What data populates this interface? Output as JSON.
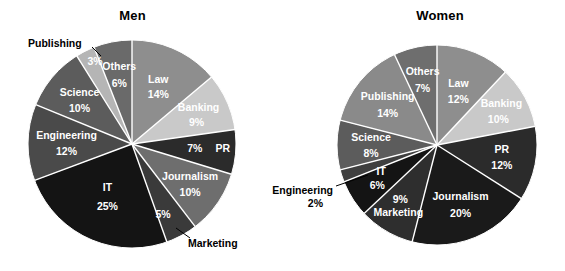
{
  "figure": {
    "background": "#ffffff",
    "label_color_inside": "#ffffff",
    "label_color_outside": "#000000",
    "separator_color": "#ffffff"
  },
  "chart_data": [
    {
      "type": "pie",
      "title": "Men",
      "unit": "%",
      "start_angle_deg": 0,
      "direction": "clockwise",
      "legend": "none",
      "categories": [
        "Law",
        "Banking",
        "PR",
        "Journalism",
        "Marketing",
        "IT",
        "Engineering",
        "Science",
        "Publishing",
        "Others"
      ],
      "values": [
        14,
        9,
        7,
        10,
        5,
        25,
        12,
        10,
        3,
        6
      ],
      "labels": [
        {
          "name": "Law",
          "value": "14%",
          "placement": "inside"
        },
        {
          "name": "Banking",
          "value": "9%",
          "placement": "inside"
        },
        {
          "name": "PR",
          "value": "7%",
          "placement": "inside"
        },
        {
          "name": "Journalism",
          "value": "10%",
          "placement": "inside"
        },
        {
          "name": "Marketing",
          "value": "5%",
          "placement": "outside-leader"
        },
        {
          "name": "IT",
          "value": "25%",
          "placement": "inside"
        },
        {
          "name": "Engineering",
          "value": "12%",
          "placement": "inside"
        },
        {
          "name": "Science",
          "value": "10%",
          "placement": "inside"
        },
        {
          "name": "Publishing",
          "value": "3%",
          "placement": "outside-leader"
        },
        {
          "name": "Others",
          "value": "6%",
          "placement": "inside"
        }
      ],
      "colors": [
        "#8e8e8e",
        "#c9c9c9",
        "#2b2b2b",
        "#6e6e6e",
        "#3a3a3a",
        "#141414",
        "#4a4a4a",
        "#5c5c5c",
        "#b5b5b5",
        "#6a6a6a"
      ]
    },
    {
      "type": "pie",
      "title": "Women",
      "unit": "%",
      "start_angle_deg": 0,
      "direction": "clockwise",
      "legend": "none",
      "categories": [
        "Law",
        "Banking",
        "PR",
        "Journalism",
        "Marketing",
        "IT",
        "Engineering",
        "Science",
        "Publishing",
        "Others"
      ],
      "values": [
        12,
        10,
        12,
        20,
        9,
        6,
        2,
        8,
        14,
        7
      ],
      "labels": [
        {
          "name": "Law",
          "value": "12%",
          "placement": "inside"
        },
        {
          "name": "Banking",
          "value": "10%",
          "placement": "inside"
        },
        {
          "name": "PR",
          "value": "12%",
          "placement": "inside"
        },
        {
          "name": "Journalism",
          "value": "20%",
          "placement": "inside"
        },
        {
          "name": "Marketing",
          "value": "9%",
          "placement": "inside"
        },
        {
          "name": "IT",
          "value": "6%",
          "placement": "inside"
        },
        {
          "name": "Engineering",
          "value": "2%",
          "placement": "outside-leader"
        },
        {
          "name": "Science",
          "value": "8%",
          "placement": "inside"
        },
        {
          "name": "Publishing",
          "value": "14%",
          "placement": "inside"
        },
        {
          "name": "Others",
          "value": "7%",
          "placement": "inside"
        }
      ],
      "colors": [
        "#8e8e8e",
        "#c9c9c9",
        "#2b2b2b",
        "#1a1a1a",
        "#2e2e2e",
        "#141414",
        "#3f3f3f",
        "#5c5c5c",
        "#8a8a8a",
        "#6e6e6e"
      ]
    }
  ],
  "men": {
    "title": "Men",
    "slices": {
      "law": {
        "name": "Law",
        "pct": "14%"
      },
      "banking": {
        "name": "Banking",
        "pct": "9%"
      },
      "pr": {
        "name": "PR",
        "pct": "7%"
      },
      "journalism": {
        "name": "Journalism",
        "pct": "10%"
      },
      "marketing": {
        "name": "Marketing",
        "pct": "5%"
      },
      "it": {
        "name": "IT",
        "pct": "25%"
      },
      "engineering": {
        "name": "Engineering",
        "pct": "12%"
      },
      "science": {
        "name": "Science",
        "pct": "10%"
      },
      "publishing": {
        "name": "Publishing",
        "pct": "3%"
      },
      "others": {
        "name": "Others",
        "pct": "6%"
      }
    }
  },
  "women": {
    "title": "Women",
    "slices": {
      "law": {
        "name": "Law",
        "pct": "12%"
      },
      "banking": {
        "name": "Banking",
        "pct": "10%"
      },
      "pr": {
        "name": "PR",
        "pct": "12%"
      },
      "journalism": {
        "name": "Journalism",
        "pct": "20%"
      },
      "marketing": {
        "name": "Marketing",
        "pct": "9%"
      },
      "it": {
        "name": "IT",
        "pct": "6%"
      },
      "engineering": {
        "name": "Engineering",
        "pct": "2%"
      },
      "science": {
        "name": "Science",
        "pct": "8%"
      },
      "publishing": {
        "name": "Publishing",
        "pct": "14%"
      },
      "others": {
        "name": "Others",
        "pct": "7%"
      }
    }
  }
}
